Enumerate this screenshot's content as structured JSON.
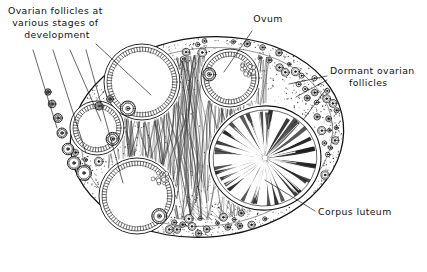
{
  "figure": {
    "kind": "anatomical-line-drawing",
    "background_color": "#ffffff",
    "ink_color": "#1a1a1a"
  },
  "labels": {
    "follicles_stages": {
      "name": "ovarian-follicles-stages-label",
      "lines": [
        "Ovarian  follicles  at",
        "various  stages  of",
        "development"
      ],
      "align": "center",
      "x": 57,
      "y": 14,
      "leader_count": 5
    },
    "ovum": {
      "name": "ovum-label",
      "lines": [
        "Ovum"
      ],
      "align": "center",
      "x": 268,
      "y": 22,
      "leader_count": 1
    },
    "dormant": {
      "name": "dormant-ovarian-follicles-label",
      "lines": [
        "Dormant  ovarian",
        "follicles"
      ],
      "align": "left",
      "x": 330,
      "y": 74,
      "leader_count": 3
    },
    "corpus_luteum": {
      "name": "corpus-luteum-label",
      "lines": [
        "Corpus  luteum"
      ],
      "align": "left",
      "x": 318,
      "y": 215,
      "leader_count": 1
    }
  },
  "structures": {
    "ovary_outline": {
      "name": "ovary-outline",
      "shape": "ellipse",
      "cx": 207,
      "cy": 137,
      "rx": 137,
      "ry": 100,
      "rotation_deg": -6
    },
    "cortex": {
      "name": "ovary-cortex",
      "description": "stippled outer band containing dormant follicles",
      "thickness": 18
    },
    "medulla": {
      "name": "ovary-medulla",
      "description": "wavy fibrous stroma strands through the centre"
    },
    "antral_follicles": [
      {
        "name": "antral-follicle-upper-left",
        "cx": 142,
        "cy": 82,
        "r": 38,
        "has_ovum": true,
        "ovum_angle_deg": 118
      },
      {
        "name": "antral-follicle-mid-left",
        "cx": 97,
        "cy": 128,
        "r": 27,
        "has_ovum": true,
        "ovum_angle_deg": 35
      },
      {
        "name": "antral-follicle-lower-left",
        "cx": 137,
        "cy": 196,
        "r": 38,
        "has_ovum": true,
        "ovum_angle_deg": 42
      },
      {
        "name": "antral-follicle-top-centre",
        "cx": 230,
        "cy": 78,
        "r": 29,
        "has_ovum": true,
        "ovum_angle_deg": 190
      }
    ],
    "corpus_luteum": {
      "name": "corpus-luteum-structure",
      "cx": 265,
      "cy": 158,
      "rx": 56,
      "ry": 52,
      "radial_folds": 34
    },
    "dormant_follicles": {
      "name": "dormant-follicle-group",
      "count": 58,
      "description": "small rings with central nucleus set in the cortex"
    }
  }
}
